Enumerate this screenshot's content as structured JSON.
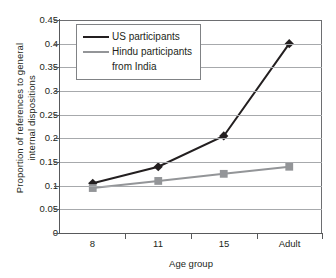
{
  "chart_data": {
    "type": "line",
    "title": "",
    "xlabel": "Age group",
    "ylabel": "Proportion of references to general internal dispositions",
    "ylabel_line1": "Proportion of references to general",
    "ylabel_line2": "internal dispositions",
    "categories": [
      "8",
      "11",
      "15",
      "Adult"
    ],
    "ylim": [
      0,
      0.45
    ],
    "ytick_labels": [
      "0",
      "0.05",
      "0.1",
      "0.15",
      "0.2",
      "0.25",
      "0.3",
      "0.35",
      "0.4",
      "0.45"
    ],
    "ytick_values": [
      0,
      0.05,
      0.1,
      0.15,
      0.2,
      0.25,
      0.3,
      0.35,
      0.4,
      0.45
    ],
    "grid": true,
    "legend_position": "top-left",
    "series": [
      {
        "name": "US participants",
        "marker": "diamond",
        "color": "#231f20",
        "values": [
          0.105,
          0.14,
          0.205,
          0.4
        ]
      },
      {
        "name": "Hindu participants from India",
        "name_line1": "Hindu participants",
        "name_line2": "from India",
        "marker": "square",
        "color": "#939598",
        "values": [
          0.095,
          0.11,
          0.125,
          0.14
        ]
      }
    ]
  }
}
